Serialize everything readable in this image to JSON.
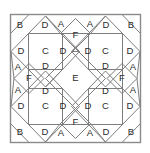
{
  "figure": {
    "background_color": "#ffffff",
    "line_color": "#8a8a8a",
    "inner_line_color": "#7d7d7d",
    "label_color": "#2b2b2b",
    "frame": {
      "x": 10,
      "y": 14,
      "width": 131,
      "height": 129
    },
    "piece_types": [
      "A",
      "B",
      "C",
      "D",
      "E",
      "F"
    ]
  },
  "labels": [
    {
      "id": "b-top-left",
      "text": "B",
      "x": 20,
      "y": 25
    },
    {
      "id": "d-top-left",
      "text": "D",
      "x": 45,
      "y": 25
    },
    {
      "id": "a-top-left",
      "text": "A",
      "x": 61,
      "y": 24
    },
    {
      "id": "a-top-right",
      "text": "A",
      "x": 90,
      "y": 24
    },
    {
      "id": "d-top-right",
      "text": "D",
      "x": 106,
      "y": 25
    },
    {
      "id": "b-top-right",
      "text": "B",
      "x": 131,
      "y": 25
    },
    {
      "id": "f-top",
      "text": "F",
      "x": 75.5,
      "y": 35
    },
    {
      "id": "d-left-upper",
      "text": "D",
      "x": 21,
      "y": 51
    },
    {
      "id": "c-top-left",
      "text": "C",
      "x": 45.5,
      "y": 51.5
    },
    {
      "id": "d-inner-tl-right",
      "text": "D",
      "x": 63,
      "y": 51
    },
    {
      "id": "d-inner-tr-left",
      "text": "D",
      "x": 88,
      "y": 51
    },
    {
      "id": "c-top-right",
      "text": "C",
      "x": 105.5,
      "y": 51.5
    },
    {
      "id": "d-right-upper",
      "text": "D",
      "x": 130,
      "y": 51
    },
    {
      "id": "a-left-upper",
      "text": "A",
      "x": 18,
      "y": 67
    },
    {
      "id": "a-right-upper",
      "text": "A",
      "x": 133,
      "y": 67
    },
    {
      "id": "d-inner-top-left",
      "text": "D",
      "x": 45.5,
      "y": 66
    },
    {
      "id": "d-inner-top-right",
      "text": "D",
      "x": 105.5,
      "y": 66
    },
    {
      "id": "f-left",
      "text": "F",
      "x": 29,
      "y": 78.5
    },
    {
      "id": "e-center",
      "text": "E",
      "x": 75.5,
      "y": 78.5
    },
    {
      "id": "f-right",
      "text": "F",
      "x": 122,
      "y": 78.5
    },
    {
      "id": "d-inner-bot-left",
      "text": "D",
      "x": 45.5,
      "y": 91
    },
    {
      "id": "d-inner-bot-right",
      "text": "D",
      "x": 105.5,
      "y": 91
    },
    {
      "id": "a-left-lower",
      "text": "A",
      "x": 18,
      "y": 90
    },
    {
      "id": "a-right-lower",
      "text": "A",
      "x": 133,
      "y": 90
    },
    {
      "id": "d-left-lower",
      "text": "D",
      "x": 21,
      "y": 106
    },
    {
      "id": "c-bottom-left",
      "text": "C",
      "x": 45.5,
      "y": 106.5
    },
    {
      "id": "d-inner-bl-right",
      "text": "D",
      "x": 63,
      "y": 106
    },
    {
      "id": "d-inner-br-left",
      "text": "D",
      "x": 88,
      "y": 106
    },
    {
      "id": "c-bottom-right",
      "text": "C",
      "x": 105.5,
      "y": 106.5
    },
    {
      "id": "d-right-lower",
      "text": "D",
      "x": 130,
      "y": 106
    },
    {
      "id": "f-bottom",
      "text": "F",
      "x": 75.5,
      "y": 122
    },
    {
      "id": "b-bottom-left",
      "text": "B",
      "x": 20,
      "y": 132
    },
    {
      "id": "d-bottom-left",
      "text": "D",
      "x": 45,
      "y": 132
    },
    {
      "id": "a-bottom-left",
      "text": "A",
      "x": 61,
      "y": 133
    },
    {
      "id": "a-bottom-right",
      "text": "A",
      "x": 90,
      "y": 133
    },
    {
      "id": "d-bottom-right",
      "text": "D",
      "x": 106,
      "y": 132
    },
    {
      "id": "b-bottom-right",
      "text": "B",
      "x": 131,
      "y": 132
    }
  ],
  "geometry": {
    "frame_rect": {
      "x": 10.5,
      "y": 14.5,
      "width": 130,
      "height": 128
    },
    "squares": [
      {
        "id": "square-c-top-left",
        "x": 28.5,
        "y": 33.5,
        "width": 34,
        "height": 36
      },
      {
        "id": "square-c-top-right",
        "x": 88.5,
        "y": 33.5,
        "width": 34,
        "height": 36
      },
      {
        "id": "square-c-bottom-left",
        "x": 28.5,
        "y": 88.5,
        "width": 34,
        "height": 36
      },
      {
        "id": "square-c-bottom-right",
        "x": 88.5,
        "y": 88.5,
        "width": 34,
        "height": 36
      }
    ],
    "diamonds": [
      {
        "id": "diamond-e-center",
        "cx": 75.5,
        "cy": 78.5,
        "rx": 29,
        "ry": 30
      },
      {
        "id": "diamond-f-top",
        "cx": 75.5,
        "cy": 33.5,
        "rx": 15,
        "ry": 15
      },
      {
        "id": "diamond-f-bottom",
        "cx": 75.5,
        "cy": 123.5,
        "rx": 15,
        "ry": 15
      },
      {
        "id": "diamond-f-left",
        "cx": 29,
        "cy": 78.5,
        "rx": 15,
        "ry": 15
      },
      {
        "id": "diamond-f-right",
        "cx": 122,
        "cy": 78.5,
        "rx": 15,
        "ry": 15
      }
    ],
    "diagonals": [
      {
        "id": "diag-tl-octagon-1",
        "x1": 28.5,
        "y1": 33.5,
        "x2": 45.5,
        "y2": 16
      },
      {
        "id": "diag-tl-octagon-2",
        "x1": 62.5,
        "y1": 33.5,
        "x2": 45.5,
        "y2": 16
      },
      {
        "id": "diag-tl-octagon-3",
        "x1": 28.5,
        "y1": 69.5,
        "x2": 11,
        "y2": 51.5
      },
      {
        "id": "diag-tl-octagon-4",
        "x1": 28.5,
        "y1": 33.5,
        "x2": 11,
        "y2": 51.5
      },
      {
        "id": "diag-tl-octagon-5",
        "x1": 28.5,
        "y1": 69.5,
        "x2": 45.5,
        "y2": 87
      },
      {
        "id": "diag-tl-octagon-6",
        "x1": 62.5,
        "y1": 69.5,
        "x2": 45.5,
        "y2": 87
      },
      {
        "id": "diag-tl-octagon-7",
        "x1": 62.5,
        "y1": 33.5,
        "x2": 79,
        "y2": 51.5
      },
      {
        "id": "diag-tl-octagon-8",
        "x1": 62.5,
        "y1": 69.5,
        "x2": 79,
        "y2": 51.5
      }
    ]
  }
}
